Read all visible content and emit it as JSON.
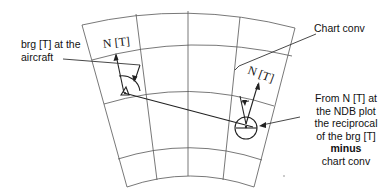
{
  "diagram": {
    "type": "chart-convergency-NDB-bearing-plot",
    "labels": {
      "aircraft_bearing": [
        "brg [T] at the",
        "aircraft"
      ],
      "chart_conv": "Chart conv",
      "north_true_aircraft": "N [T]",
      "north_true_ndb": "N [T]",
      "ndb_instruction": [
        "From N [T] at",
        "the NDB plot",
        "the reciprocal",
        "of the brg [T]"
      ],
      "ndb_instruction_bold": "minus",
      "ndb_instruction_tail": "chart conv"
    },
    "elements": {
      "aircraft_symbol": "aircraft-triangle",
      "ndb_symbol": "ndb-circle",
      "grid": "lambert-chart-graticule"
    },
    "colors": {
      "ink": "#222222",
      "grid": "#555555",
      "background": "#ffffff"
    }
  }
}
